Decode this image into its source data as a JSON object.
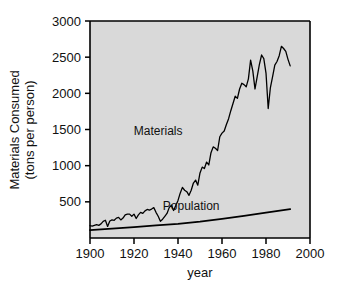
{
  "chart_data": {
    "type": "line",
    "title": "",
    "xlabel": "year",
    "ylabel": "Materials Consumed\n(tons per person)",
    "ylabel_line1": "Materials Consumed",
    "ylabel_line2": "(tons per person)",
    "xlim": [
      1900,
      2000
    ],
    "ylim": [
      0,
      3000
    ],
    "grid": false,
    "legend_position": "inline-annotations",
    "plot_background": "#d9d9d9",
    "line_color": "#000000",
    "xticks": [
      1900,
      1920,
      1940,
      1960,
      1980,
      2000
    ],
    "xtick_labels": [
      "1900",
      "1920",
      "1940",
      "1960",
      "1980",
      "2000"
    ],
    "yticks": [
      500,
      1000,
      1500,
      2000,
      2500,
      3000
    ],
    "ytick_labels": [
      "500",
      "1000",
      "1500",
      "2000",
      "2500",
      "3000"
    ],
    "annotations": [
      {
        "text": "Materials",
        "x": 1931,
        "y": 1420
      },
      {
        "text": "Population",
        "x": 1946,
        "y": 390
      }
    ],
    "series": [
      {
        "name": "Materials",
        "x": [
          1900,
          1901,
          1902,
          1903,
          1904,
          1905,
          1906,
          1907,
          1908,
          1909,
          1910,
          1911,
          1912,
          1913,
          1914,
          1915,
          1916,
          1917,
          1918,
          1919,
          1920,
          1921,
          1922,
          1923,
          1924,
          1925,
          1926,
          1927,
          1928,
          1929,
          1930,
          1931,
          1932,
          1933,
          1934,
          1935,
          1936,
          1937,
          1938,
          1939,
          1940,
          1941,
          1942,
          1943,
          1944,
          1945,
          1946,
          1947,
          1948,
          1949,
          1950,
          1951,
          1952,
          1953,
          1954,
          1955,
          1956,
          1957,
          1958,
          1959,
          1960,
          1961,
          1962,
          1963,
          1964,
          1965,
          1966,
          1967,
          1968,
          1969,
          1970,
          1971,
          1972,
          1973,
          1974,
          1975,
          1976,
          1977,
          1978,
          1979,
          1980,
          1981,
          1982,
          1983,
          1984,
          1985,
          1986,
          1987,
          1988,
          1989,
          1990,
          1991
        ],
        "values": [
          170,
          165,
          175,
          185,
          175,
          195,
          230,
          245,
          160,
          235,
          250,
          245,
          275,
          285,
          250,
          275,
          320,
          330,
          330,
          300,
          330,
          270,
          320,
          355,
          340,
          375,
          395,
          385,
          400,
          420,
          355,
          300,
          230,
          260,
          300,
          340,
          420,
          455,
          380,
          450,
          520,
          620,
          700,
          660,
          640,
          590,
          660,
          760,
          800,
          730,
          900,
          980,
          960,
          1050,
          1010,
          1180,
          1260,
          1240,
          1210,
          1400,
          1450,
          1480,
          1570,
          1650,
          1760,
          1860,
          1960,
          1930,
          2060,
          2140,
          2120,
          2090,
          2200,
          2460,
          2310,
          2060,
          2230,
          2400,
          2530,
          2480,
          2280,
          1790,
          2080,
          2230,
          2390,
          2440,
          2520,
          2650,
          2620,
          2580,
          2470,
          2380
        ]
      },
      {
        "name": "Population",
        "x": [
          1900,
          1910,
          1920,
          1930,
          1940,
          1950,
          1960,
          1970,
          1980,
          1991
        ],
        "values": [
          110,
          130,
          150,
          175,
          195,
          225,
          265,
          305,
          350,
          400
        ]
      }
    ]
  }
}
